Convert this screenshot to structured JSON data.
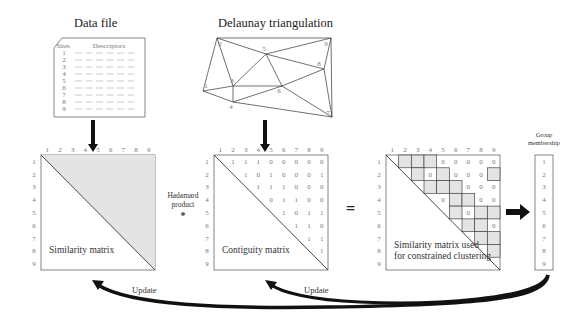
{
  "data_file": {
    "title": "Data file",
    "col_sites": "Sites",
    "col_descriptors": "Descriptors",
    "rows": [
      "1",
      "2",
      "3",
      "4",
      "5",
      "6",
      "7",
      "8",
      "9"
    ]
  },
  "triangulation": {
    "title": "Delaunay triangulation",
    "nodes": [
      {
        "id": "1",
        "x": 203,
        "y": 91
      },
      {
        "id": "2",
        "x": 217,
        "y": 38
      },
      {
        "id": "3",
        "x": 233,
        "y": 86
      },
      {
        "id": "4",
        "x": 233,
        "y": 102
      },
      {
        "id": "5",
        "x": 266,
        "y": 54
      },
      {
        "id": "6",
        "x": 282,
        "y": 86
      },
      {
        "id": "7",
        "x": 332,
        "y": 117
      },
      {
        "id": "8",
        "x": 324,
        "y": 69
      },
      {
        "id": "9",
        "x": 331,
        "y": 38
      }
    ],
    "edges": [
      [
        "1",
        "2"
      ],
      [
        "1",
        "3"
      ],
      [
        "1",
        "4"
      ],
      [
        "2",
        "3"
      ],
      [
        "2",
        "5"
      ],
      [
        "2",
        "9"
      ],
      [
        "3",
        "4"
      ],
      [
        "3",
        "5"
      ],
      [
        "3",
        "6"
      ],
      [
        "4",
        "6"
      ],
      [
        "4",
        "7"
      ],
      [
        "5",
        "6"
      ],
      [
        "5",
        "8"
      ],
      [
        "5",
        "9"
      ],
      [
        "6",
        "7"
      ],
      [
        "6",
        "8"
      ],
      [
        "7",
        "8"
      ],
      [
        "7",
        "9"
      ],
      [
        "8",
        "9"
      ]
    ]
  },
  "similarity_matrix": {
    "label": "Similarity matrix",
    "indices": [
      "1",
      "2",
      "3",
      "4",
      "5",
      "6",
      "7",
      "8",
      "9"
    ]
  },
  "operator": {
    "label_line1": "Hadamard",
    "label_line2": "product",
    "symbol": "*"
  },
  "contiguity_matrix": {
    "label": "Contiguity matrix",
    "indices": [
      "1",
      "2",
      "3",
      "4",
      "5",
      "6",
      "7",
      "8",
      "9"
    ],
    "upper": [
      [
        1,
        1,
        1,
        0,
        0,
        0,
        0,
        0
      ],
      [
        1,
        0,
        1,
        0,
        0,
        0,
        1
      ],
      [
        1,
        1,
        1,
        0,
        0,
        0
      ],
      [
        0,
        1,
        1,
        0,
        0
      ],
      [
        1,
        0,
        1,
        1
      ],
      [
        1,
        1,
        0
      ],
      [
        1,
        1
      ],
      [
        1
      ]
    ]
  },
  "equals": "=",
  "constrained_matrix": {
    "label_line1": "Similarity matrix used",
    "label_line2": "for constrained clustering",
    "indices": [
      "1",
      "2",
      "3",
      "4",
      "5",
      "6",
      "7",
      "8",
      "9"
    ],
    "zero_text": "0"
  },
  "group_membership": {
    "title_line1": "Group",
    "title_line2": "membership",
    "values": [
      "1",
      "2",
      "3",
      "4",
      "5",
      "6",
      "7",
      "8",
      "9"
    ]
  },
  "feedback": {
    "update_left": "Update",
    "update_right": "Update"
  },
  "colors": {
    "shade": "#e4e4e4",
    "line": "#555555",
    "arrow": "#111111"
  }
}
